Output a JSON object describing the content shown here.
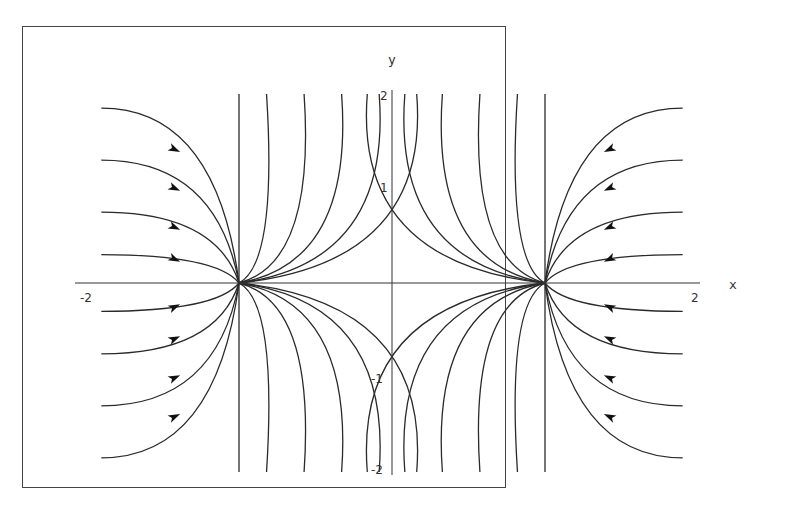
{
  "chart_data": {
    "type": "line",
    "title": "",
    "subtitle": "Phase portrait (direction field with trajectories)",
    "xlabel": "x",
    "ylabel": "y",
    "xlim": [
      -2,
      2
    ],
    "ylim": [
      -2,
      2
    ],
    "x_ticks": [
      -2,
      2
    ],
    "y_ticks": [
      -2,
      -1,
      1,
      2
    ],
    "grid": false,
    "legend": null,
    "equilibria": [
      {
        "x": -1,
        "y": 0,
        "type": "node"
      },
      {
        "x": 1,
        "y": 0,
        "type": "node"
      }
    ],
    "series": [
      {
        "name": "left-fan trajectories into (-1,0)",
        "start_y": [
          1.85,
          1.3,
          0.75,
          0.3,
          -0.3,
          -0.75,
          -1.3,
          -1.85
        ]
      },
      {
        "name": "central trajectories from (-1,0)",
        "count": 5
      },
      {
        "name": "central trajectories from (1,0)",
        "count": 5
      },
      {
        "name": "right-fan trajectories into (1,0)",
        "start_y": [
          1.85,
          1.3,
          0.75,
          0.3,
          -0.3,
          -0.75,
          -1.3,
          -1.85
        ]
      }
    ]
  },
  "axes": {
    "x_label": "x",
    "y_label": "y",
    "tick_neg2_x": "-2",
    "tick_pos2_x": "2",
    "tick_pos2_y": "2",
    "tick_pos1_y": "1",
    "tick_neg1_y": "-1",
    "tick_neg2_y": "-2"
  },
  "colors": {
    "line": "#2a2a2a",
    "frame": "#444444"
  }
}
